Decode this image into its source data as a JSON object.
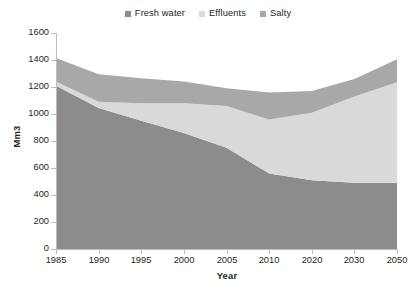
{
  "chart_data": {
    "type": "area",
    "stacked": true,
    "title": "",
    "subtitle": "",
    "xlabel": "Year",
    "ylabel": "Mm3",
    "categories": [
      "1985",
      "1990",
      "1995",
      "2000",
      "2005",
      "2010",
      "2020",
      "2030",
      "2050"
    ],
    "x": [
      1985,
      1990,
      1995,
      2000,
      2005,
      2010,
      2020,
      2030,
      2050
    ],
    "series": [
      {
        "name": "Fresh water",
        "color": "#8c8c8c",
        "values": [
          1210,
          1045,
          950,
          860,
          750,
          560,
          510,
          490,
          490
        ]
      },
      {
        "name": "Effluents",
        "color": "#d9d9d9",
        "values": [
          30,
          45,
          130,
          220,
          310,
          400,
          500,
          640,
          745
        ]
      },
      {
        "name": "Salty",
        "color": "#a8a8a8",
        "values": [
          175,
          205,
          185,
          160,
          130,
          200,
          160,
          130,
          170
        ]
      }
    ],
    "totals": [
      1415,
      1295,
      1265,
      1240,
      1190,
      1160,
      1170,
      1260,
      1405
    ],
    "ylim": [
      0,
      1600
    ],
    "ytick_values": [
      0,
      200,
      400,
      600,
      800,
      1000,
      1200,
      1400,
      1600
    ],
    "ytick_labels": [
      "0",
      "200",
      "400",
      "600",
      "800",
      "1000",
      "1200",
      "1400",
      "1600"
    ],
    "xtick_labels": [
      "1985",
      "1990",
      "1995",
      "2000",
      "2005",
      "2010",
      "2020",
      "2030",
      "2050"
    ],
    "grid": false,
    "legend_position": "top-center",
    "legend_entries": [
      "Fresh water",
      "Effluents",
      "Salty"
    ]
  },
  "legend": {
    "items": [
      {
        "label": "Fresh water",
        "color": "#8c8c8c",
        "swatch_name": "legend-swatch-fresh-water"
      },
      {
        "label": "Effluents",
        "color": "#d9d9d9",
        "swatch_name": "legend-swatch-effluents"
      },
      {
        "label": "Salty",
        "color": "#a8a8a8",
        "swatch_name": "legend-swatch-salty"
      }
    ]
  },
  "axes": {
    "y_title": "Mm3",
    "x_title": "Year"
  },
  "colors": {
    "fresh_water": "#8c8c8c",
    "effluents": "#d9d9d9",
    "salty": "#a8a8a8",
    "axis": "#bdbdbd",
    "text": "#231f20",
    "background": "#ffffff"
  }
}
